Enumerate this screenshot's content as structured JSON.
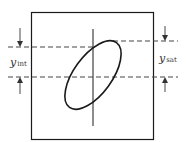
{
  "diagram": {
    "type": "ellipse-loop-with-axis",
    "labels": {
      "left": {
        "var": "y",
        "sub": "int"
      },
      "right": {
        "var": "y",
        "sub": "sat"
      }
    },
    "colors": {
      "stroke": "#1a1a1a",
      "dash": "#444444",
      "background": "#ffffff"
    }
  }
}
